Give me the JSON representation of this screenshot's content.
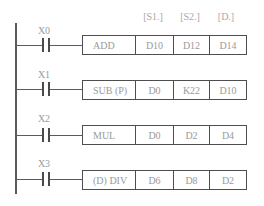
{
  "diagram": {
    "type": "ladder-diagram",
    "operand_headers": [
      "[S1.]",
      "[S2.]",
      "[D.]"
    ],
    "rungs": [
      {
        "contact": "X0",
        "instruction": "ADD",
        "s1": "D10",
        "s2": "D12",
        "d": "D14"
      },
      {
        "contact": "X1",
        "instruction": "SUB (P)",
        "s1": "D0",
        "s2": "K22",
        "d": "D10"
      },
      {
        "contact": "X2",
        "instruction": "MUL",
        "s1": "D0",
        "s2": "D2",
        "d": "D4"
      },
      {
        "contact": "X3",
        "instruction": "(D) DIV",
        "s1": "D6",
        "s2": "D8",
        "d": "D2"
      }
    ]
  }
}
